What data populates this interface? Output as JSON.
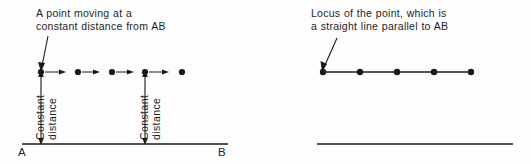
{
  "figure": {
    "background_color": "#fdfdfd",
    "ink_color": "#1a1a1a",
    "width": 531,
    "height": 164
  },
  "left_panel": {
    "caption": "A point moving at a\nconstant distance from AB",
    "leader_arrow": "arrow-down-left",
    "baseline": {
      "label_start": "A",
      "label_end": "B"
    },
    "dimension_labels": [
      {
        "word_left": "Constant",
        "word_right": "distance"
      },
      {
        "word_left": "Constant",
        "word_right": "distance"
      }
    ],
    "moving_points": [
      {
        "index": 1,
        "has_motion_arrow": true
      },
      {
        "index": 2,
        "has_motion_arrow": true
      },
      {
        "index": 3,
        "has_motion_arrow": true
      },
      {
        "index": 4,
        "has_motion_arrow": true
      },
      {
        "index": 5,
        "has_motion_arrow": false
      }
    ]
  },
  "right_panel": {
    "caption": "Locus of the point, which is\na straight line parallel to AB",
    "leader_arrow": "arrow-down-left",
    "baseline": {
      "label_start": "A",
      "label_end": "B"
    },
    "locus_points": [
      {
        "index": 1
      },
      {
        "index": 2
      },
      {
        "index": 3
      },
      {
        "index": 4
      },
      {
        "index": 5
      }
    ]
  }
}
